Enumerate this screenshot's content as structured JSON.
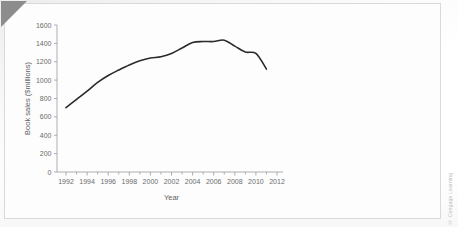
{
  "figure": {
    "background_color": "#fdfdfd",
    "frame_color": "#d9d9d9",
    "corner_fold_color": "#8c8c8c",
    "watermark_text": "",
    "credit_text": "© Cengage Learning"
  },
  "chart_data": {
    "type": "line",
    "title": "",
    "xlabel": "Year",
    "ylabel": "Book sales ($millions)",
    "xlim": [
      1991,
      2012
    ],
    "ylim": [
      0,
      1600
    ],
    "grid": false,
    "legend": null,
    "line_color": "#2b2b2b",
    "x_tick_labels": [
      "1992",
      "1994",
      "1996",
      "1998",
      "2000",
      "2002",
      "2004",
      "2006",
      "2008",
      "2010",
      "2012"
    ],
    "x_tick_values": [
      1992,
      1994,
      1996,
      1998,
      2000,
      2002,
      2004,
      2006,
      2008,
      2010,
      2012
    ],
    "x_minor_tick_values": [
      1993,
      1995,
      1997,
      1999,
      2001,
      2003,
      2005,
      2007,
      2009,
      2011
    ],
    "y_tick_labels": [
      "0",
      "200",
      "400",
      "600",
      "800",
      "1000",
      "1200",
      "1400",
      "1600"
    ],
    "y_tick_values": [
      0,
      200,
      400,
      600,
      800,
      1000,
      1200,
      1400,
      1600
    ],
    "x": [
      1992,
      1993,
      1994,
      1995,
      1996,
      1997,
      1998,
      1999,
      2000,
      2001,
      2002,
      2003,
      2004,
      2005,
      2006,
      2007,
      2008,
      2009,
      2010,
      2011
    ],
    "values": [
      700,
      790,
      880,
      975,
      1050,
      1110,
      1165,
      1210,
      1240,
      1255,
      1290,
      1350,
      1410,
      1420,
      1420,
      1435,
      1370,
      1305,
      1290,
      1120
    ],
    "series": [
      {
        "name": "Book sales",
        "values": [
          700,
          790,
          880,
          975,
          1050,
          1110,
          1165,
          1210,
          1240,
          1255,
          1290,
          1350,
          1410,
          1420,
          1420,
          1435,
          1370,
          1305,
          1290,
          1120
        ]
      }
    ]
  }
}
